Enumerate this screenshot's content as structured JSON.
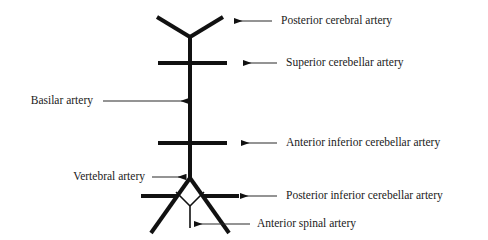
{
  "diagram": {
    "type": "anatomical-line-diagram",
    "stroke_color": "#111111",
    "text_color": "#1a1a1a",
    "background_color": "#ffffff",
    "vessel_stroke_width": 4,
    "thin_stroke_width": 1.6,
    "leader_stroke_width": 1.2
  },
  "labels": {
    "posterior_cerebral": "Posterior cerebral artery",
    "superior_cerebellar": "Superior cerebellar artery",
    "basilar": "Basilar artery",
    "anterior_inferior_cerebellar": "Anterior inferior cerebellar artery",
    "vertebral": "Vertebral artery",
    "posterior_inferior_cerebellar": "Posterior inferior cerebellar artery",
    "anterior_spinal": "Anterior spinal artery"
  },
  "vessels": [
    {
      "name": "basilar-trunk",
      "label": "Basilar artery"
    },
    {
      "name": "posterior-cerebral-fork",
      "label": "Posterior cerebral artery"
    },
    {
      "name": "superior-cerebellar-crossbar",
      "label": "Superior cerebellar artery"
    },
    {
      "name": "anterior-inferior-cerebellar-crossbar",
      "label": "Anterior inferior cerebellar artery"
    },
    {
      "name": "vertebral-left-leg",
      "label": "Vertebral artery"
    },
    {
      "name": "vertebral-right-leg",
      "label": "Vertebral artery"
    },
    {
      "name": "posterior-inferior-cerebellar-left",
      "label": "Posterior inferior cerebellar artery"
    },
    {
      "name": "posterior-inferior-cerebellar-right",
      "label": "Posterior inferior cerebellar artery"
    },
    {
      "name": "anterior-spinal-v",
      "label": "Anterior spinal artery"
    }
  ]
}
